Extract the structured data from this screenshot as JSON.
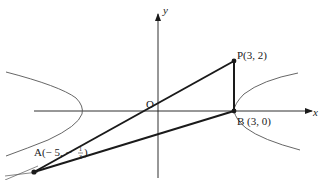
{
  "diagram": {
    "axes": {
      "x_label": "x",
      "y_label": "y",
      "origin_label": "O"
    },
    "points": {
      "A": {
        "label": "A(− 5, −",
        "frac_num": "1",
        "frac_den": "3",
        "close": ")"
      },
      "P": {
        "label": "P(3, 2)"
      },
      "B": {
        "label": "B (3, 0)"
      }
    },
    "colors": {
      "ink": "#1a1a1a",
      "curve": "#555555",
      "background": "#ffffff"
    }
  }
}
